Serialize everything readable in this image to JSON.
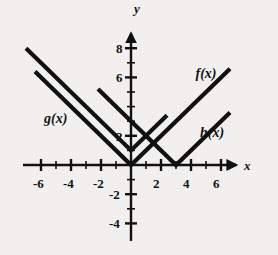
{
  "figure": {
    "background_color": "#f2f1ef",
    "ink_color": "#111111"
  },
  "axes": {
    "x_axis_name": "x",
    "y_axis_name": "y",
    "x_tick_labels": [
      "-6",
      "-4",
      "-2",
      "2",
      "4",
      "6"
    ],
    "y_tick_labels": [
      "8",
      "6",
      "2",
      "-2",
      "-4"
    ]
  },
  "curve_labels": {
    "f": "f(x)",
    "g": "g(x)",
    "h": "h(x)"
  },
  "chart_data": {
    "type": "line",
    "title": "",
    "xlabel": "x",
    "ylabel": "y",
    "xlim": [
      -7.2,
      7.4
    ],
    "ylim": [
      -5.2,
      9.4
    ],
    "grid": false,
    "legend": "inline-labels",
    "x_ticks": [
      -6,
      -4,
      -2,
      2,
      4,
      6
    ],
    "x_tick_labels": [
      "-6",
      "-4",
      "-2",
      "2",
      "4",
      "6"
    ],
    "x_minor_ticks": [
      -5,
      -3,
      -1,
      1,
      3,
      5
    ],
    "y_ticks": [
      8,
      6,
      2,
      -2,
      -4
    ],
    "y_tick_labels": [
      "8",
      "6",
      "2",
      "-2",
      "-4"
    ],
    "y_minor_ticks": [
      7,
      5,
      4,
      3,
      1,
      -1,
      -3
    ],
    "series": [
      {
        "name": "f(x)",
        "expression": "|x|",
        "vertex": [
          0,
          0
        ],
        "slope": 1,
        "x": [
          -6.4,
          0,
          6.6
        ],
        "y": [
          6.4,
          0,
          6.6
        ]
      },
      {
        "name": "g(x)",
        "expression": "|x| + 1",
        "vertex": [
          0,
          1
        ],
        "slope": 1,
        "x": [
          -7.0,
          0,
          2.4
        ],
        "y": [
          8.0,
          1,
          3.4
        ]
      },
      {
        "name": "h(x)",
        "expression": "|x - 3|",
        "vertex": [
          3,
          0
        ],
        "slope": 1,
        "x": [
          -2.2,
          3,
          6.6
        ],
        "y": [
          5.2,
          0,
          3.6
        ]
      }
    ],
    "annotations": [
      {
        "text": "f(x)",
        "x": 4.3,
        "y": 6.7
      },
      {
        "text": "g(x)",
        "x": -5.8,
        "y": 3.6
      },
      {
        "text": "h(x)",
        "x": 4.6,
        "y": 2.7
      }
    ]
  }
}
